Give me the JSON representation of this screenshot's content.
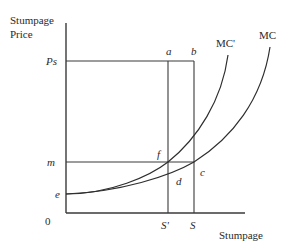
{
  "figure": {
    "y_axis_title_line1": "Stumpage",
    "y_axis_title_line2": "Price",
    "x_axis_title": "Stumpage",
    "origin_label": "0",
    "y_ticks": {
      "ps": "Ps",
      "m": "m",
      "e": "e"
    },
    "x_ticks": {
      "s_prime": "S'",
      "s": "S"
    },
    "points": {
      "a": "a",
      "b": "b",
      "c": "c",
      "d": "d",
      "f": "f"
    },
    "curves": {
      "mc_prime": "MC'",
      "mc": "MC"
    }
  },
  "colors": {
    "line": "#3a3a3a",
    "text": "#2a2a2a",
    "background": "#ffffff"
  }
}
